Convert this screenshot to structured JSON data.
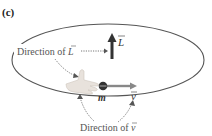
{
  "panel_label": "(c)",
  "labels": {
    "direction_L": "Direction of L",
    "direction_v": "Direction of v",
    "L_symbol": "L",
    "v_symbol": "v",
    "mass_symbol": "m"
  },
  "colors": {
    "orbit": "#555555",
    "text": "#555555",
    "arrow_L": "#333333",
    "velocity_arrow": "#888888",
    "hand": "#e8e2dc",
    "mass": "#333333",
    "dotted": "#777777"
  }
}
